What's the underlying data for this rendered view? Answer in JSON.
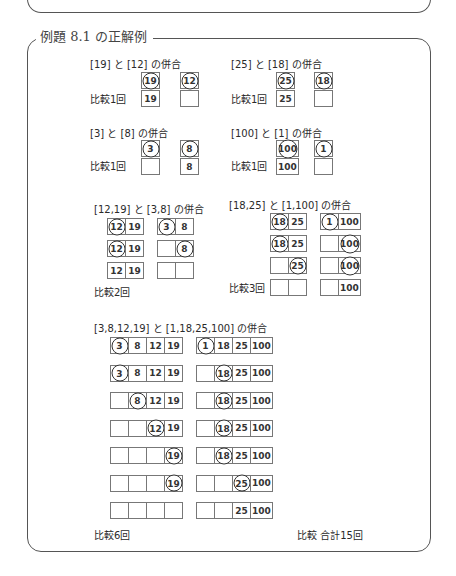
{
  "frame": {
    "title": "例題 8.1 の正解例"
  },
  "merges": [
    {
      "id": "m1",
      "label": "[19] と [12] の併合",
      "compare": "比較1回",
      "rows": [
        {
          "left": [
            {
              "v": "19",
              "c": true
            }
          ],
          "right": [
            {
              "v": "12",
              "c": true
            }
          ]
        },
        {
          "left": [
            {
              "v": "19",
              "c": false
            }
          ],
          "right": [
            {
              "v": "",
              "c": false
            }
          ]
        }
      ]
    },
    {
      "id": "m2",
      "label": "[25] と [18] の併合",
      "compare": "比較1回",
      "rows": [
        {
          "left": [
            {
              "v": "25",
              "c": true
            }
          ],
          "right": [
            {
              "v": "18",
              "c": true
            }
          ]
        },
        {
          "left": [
            {
              "v": "25",
              "c": false
            }
          ],
          "right": [
            {
              "v": "",
              "c": false
            }
          ]
        }
      ]
    },
    {
      "id": "m3",
      "label": "[3] と [8] の併合",
      "compare": "比較1回",
      "rows": [
        {
          "left": [
            {
              "v": "3",
              "c": true
            }
          ],
          "right": [
            {
              "v": "8",
              "c": true
            }
          ]
        },
        {
          "left": [
            {
              "v": "",
              "c": false
            }
          ],
          "right": [
            {
              "v": "8",
              "c": false
            }
          ]
        }
      ]
    },
    {
      "id": "m4",
      "label": "[100] と [1] の併合",
      "compare": "比較1回",
      "rows": [
        {
          "left": [
            {
              "v": "100",
              "c": true
            }
          ],
          "right": [
            {
              "v": "1",
              "c": true
            }
          ]
        },
        {
          "left": [
            {
              "v": "100",
              "c": false
            }
          ],
          "right": [
            {
              "v": "",
              "c": false
            }
          ]
        }
      ]
    },
    {
      "id": "m5",
      "label": "[12,19] と [3,8] の併合",
      "compare": "比較2回",
      "rows": [
        {
          "left": [
            {
              "v": "12",
              "c": true
            },
            {
              "v": "19",
              "c": false
            }
          ],
          "right": [
            {
              "v": "3",
              "c": true
            },
            {
              "v": "8",
              "c": false
            }
          ]
        },
        {
          "left": [
            {
              "v": "12",
              "c": true
            },
            {
              "v": "19",
              "c": false
            }
          ],
          "right": [
            {
              "v": "",
              "c": false
            },
            {
              "v": "8",
              "c": true
            }
          ]
        },
        {
          "left": [
            {
              "v": "12",
              "c": false
            },
            {
              "v": "19",
              "c": false
            }
          ],
          "right": [
            {
              "v": "",
              "c": false
            },
            {
              "v": "",
              "c": false
            }
          ]
        }
      ]
    },
    {
      "id": "m6",
      "label": "[18,25] と [1,100] の併合",
      "compare": "比較3回",
      "rows": [
        {
          "left": [
            {
              "v": "18",
              "c": true
            },
            {
              "v": "25",
              "c": false
            }
          ],
          "right": [
            {
              "v": "1",
              "c": true
            },
            {
              "v": "100",
              "c": false
            }
          ]
        },
        {
          "left": [
            {
              "v": "18",
              "c": true
            },
            {
              "v": "25",
              "c": false
            }
          ],
          "right": [
            {
              "v": "",
              "c": false
            },
            {
              "v": "100",
              "c": true
            }
          ]
        },
        {
          "left": [
            {
              "v": "",
              "c": false
            },
            {
              "v": "25",
              "c": true
            }
          ],
          "right": [
            {
              "v": "",
              "c": false
            },
            {
              "v": "100",
              "c": true
            }
          ]
        },
        {
          "left": [
            {
              "v": "",
              "c": false
            },
            {
              "v": "",
              "c": false
            }
          ],
          "right": [
            {
              "v": "",
              "c": false
            },
            {
              "v": "100",
              "c": false
            }
          ]
        }
      ]
    },
    {
      "id": "m7",
      "label": "[3,8,12,19] と [1,18,25,100] の併合",
      "compare": "比較6回",
      "rows": [
        {
          "left": [
            {
              "v": "3",
              "c": true
            },
            {
              "v": "8",
              "c": false
            },
            {
              "v": "12",
              "c": false
            },
            {
              "v": "19",
              "c": false
            }
          ],
          "right": [
            {
              "v": "1",
              "c": true
            },
            {
              "v": "18",
              "c": false
            },
            {
              "v": "25",
              "c": false
            },
            {
              "v": "100",
              "c": false
            }
          ]
        },
        {
          "left": [
            {
              "v": "3",
              "c": true
            },
            {
              "v": "8",
              "c": false
            },
            {
              "v": "12",
              "c": false
            },
            {
              "v": "19",
              "c": false
            }
          ],
          "right": [
            {
              "v": "",
              "c": false
            },
            {
              "v": "18",
              "c": true
            },
            {
              "v": "25",
              "c": false
            },
            {
              "v": "100",
              "c": false
            }
          ]
        },
        {
          "left": [
            {
              "v": "",
              "c": false
            },
            {
              "v": "8",
              "c": true
            },
            {
              "v": "12",
              "c": false
            },
            {
              "v": "19",
              "c": false
            }
          ],
          "right": [
            {
              "v": "",
              "c": false
            },
            {
              "v": "18",
              "c": true
            },
            {
              "v": "25",
              "c": false
            },
            {
              "v": "100",
              "c": false
            }
          ]
        },
        {
          "left": [
            {
              "v": "",
              "c": false
            },
            {
              "v": "",
              "c": false
            },
            {
              "v": "12",
              "c": true
            },
            {
              "v": "19",
              "c": false
            }
          ],
          "right": [
            {
              "v": "",
              "c": false
            },
            {
              "v": "18",
              "c": true
            },
            {
              "v": "25",
              "c": false
            },
            {
              "v": "100",
              "c": false
            }
          ]
        },
        {
          "left": [
            {
              "v": "",
              "c": false
            },
            {
              "v": "",
              "c": false
            },
            {
              "v": "",
              "c": false
            },
            {
              "v": "19",
              "c": true
            }
          ],
          "right": [
            {
              "v": "",
              "c": false
            },
            {
              "v": "18",
              "c": true
            },
            {
              "v": "25",
              "c": false
            },
            {
              "v": "100",
              "c": false
            }
          ]
        },
        {
          "left": [
            {
              "v": "",
              "c": false
            },
            {
              "v": "",
              "c": false
            },
            {
              "v": "",
              "c": false
            },
            {
              "v": "19",
              "c": true
            }
          ],
          "right": [
            {
              "v": "",
              "c": false
            },
            {
              "v": "",
              "c": false
            },
            {
              "v": "25",
              "c": true
            },
            {
              "v": "100",
              "c": false
            }
          ]
        },
        {
          "left": [
            {
              "v": "",
              "c": false
            },
            {
              "v": "",
              "c": false
            },
            {
              "v": "",
              "c": false
            },
            {
              "v": "",
              "c": false
            }
          ],
          "right": [
            {
              "v": "",
              "c": false
            },
            {
              "v": "",
              "c": false
            },
            {
              "v": "25",
              "c": false
            },
            {
              "v": "100",
              "c": false
            }
          ]
        }
      ]
    }
  ],
  "total": "比較 合計15回"
}
